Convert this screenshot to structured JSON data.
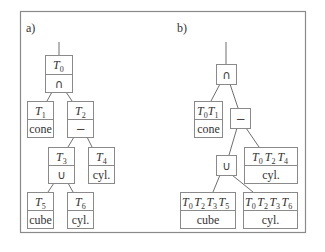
{
  "figure": {
    "panels": [
      {
        "label": "a)",
        "nodes": [
          {
            "id": "T0",
            "name": "T",
            "sub": "0",
            "content": "∩"
          },
          {
            "id": "T1",
            "name": "T",
            "sub": "1",
            "content": "cone"
          },
          {
            "id": "T2",
            "name": "T",
            "sub": "2",
            "content": "−"
          },
          {
            "id": "T3",
            "name": "T",
            "sub": "3",
            "content": "∪"
          },
          {
            "id": "T4",
            "name": "T",
            "sub": "4",
            "content": "cyl."
          },
          {
            "id": "T5",
            "name": "T",
            "sub": "5",
            "content": "cube"
          },
          {
            "id": "T6",
            "name": "T",
            "sub": "6",
            "content": "cyl."
          }
        ],
        "edges": [
          [
            "T0",
            "T1"
          ],
          [
            "T0",
            "T2"
          ],
          [
            "T2",
            "T3"
          ],
          [
            "T2",
            "T4"
          ],
          [
            "T3",
            "T5"
          ],
          [
            "T3",
            "T6"
          ]
        ]
      },
      {
        "label": "b)",
        "nodes": [
          {
            "id": "and",
            "content": "∩"
          },
          {
            "id": "cone",
            "transforms": [
              "0",
              "1"
            ],
            "content": "cone"
          },
          {
            "id": "minus",
            "content": "−"
          },
          {
            "id": "or",
            "content": "∪"
          },
          {
            "id": "cyl4",
            "transforms": [
              "0",
              "2",
              "4"
            ],
            "content": "cyl."
          },
          {
            "id": "cube",
            "transforms": [
              "0",
              "2",
              "3",
              "5"
            ],
            "content": "cube"
          },
          {
            "id": "cyl6",
            "transforms": [
              "0",
              "2",
              "3",
              "6"
            ],
            "content": "cyl."
          }
        ],
        "edges": [
          [
            "and",
            "cone"
          ],
          [
            "and",
            "minus"
          ],
          [
            "minus",
            "or"
          ],
          [
            "minus",
            "cyl4"
          ],
          [
            "or",
            "cube"
          ],
          [
            "or",
            "cyl6"
          ]
        ]
      }
    ],
    "symbol": "T"
  }
}
